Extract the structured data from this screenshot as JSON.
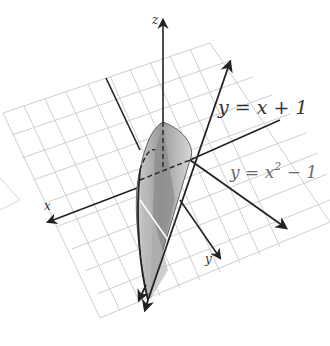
{
  "figure": {
    "type": "3d-region-diagram",
    "axes": {
      "x": {
        "label": "x"
      },
      "y": {
        "label": "y"
      },
      "z": {
        "label": "z"
      }
    },
    "curves": [
      {
        "id": "line",
        "label": "y = x + 1",
        "parts": [
          "y",
          " = ",
          "x",
          " + 1"
        ]
      },
      {
        "id": "parabola",
        "label": "y = x² − 1",
        "base": "y = x",
        "sup": "2",
        "tail": " − 1"
      }
    ],
    "colors": {
      "grid": "#cfcfcf",
      "axis": "#222222",
      "surface_light": "#d4d4d4",
      "surface_mid": "#a8a8a8",
      "surface_dark": "#7a7a7a",
      "background": "#ffffff"
    }
  }
}
